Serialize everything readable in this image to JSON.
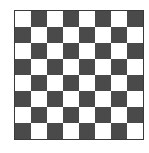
{
  "board": {
    "rows": 8,
    "cols": 8,
    "top_left": "light",
    "colors": {
      "light": "#ffffff",
      "dark": "#4a4a4a",
      "border": "#3a3a3a"
    }
  }
}
